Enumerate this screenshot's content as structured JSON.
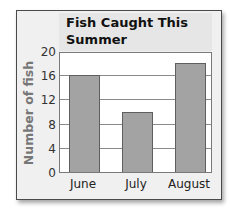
{
  "chart_data": {
    "type": "bar",
    "title": "Fish Caught This Summer",
    "title_lines": [
      "Fish Caught This",
      "Summer"
    ],
    "categories": [
      "June",
      "July",
      "August"
    ],
    "values": [
      16,
      10,
      18
    ],
    "xlabel": "",
    "ylabel": "Number of fish",
    "ylim": [
      0,
      20
    ],
    "yticks": [
      0,
      4,
      8,
      12,
      16,
      20
    ],
    "grid": true,
    "legend": null,
    "colors": {
      "bar": "#a3a3a3",
      "bar_edge": "#5f5f5f",
      "frame_bg": "#f0f0f0",
      "title_bg": "#e6e6e6"
    }
  }
}
